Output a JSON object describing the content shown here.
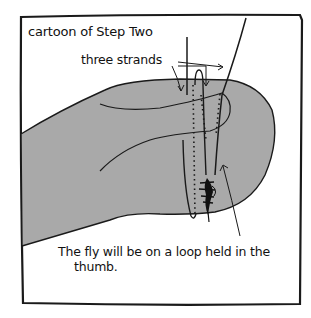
{
  "panel": {
    "title": "cartoon of Step Two",
    "annotations": {
      "strands_label": "three strands",
      "caption_line1": "The fly will be on a loop held in the",
      "caption_line2": "thumb."
    }
  },
  "colors": {
    "background": "#ffffff",
    "ink": "#111111",
    "thumb_fill": "#a9a9a9",
    "frame": "#1a1a1a"
  },
  "elements": {
    "thumb": "gray thumb shape",
    "strands_count": 3,
    "fly": "tied fly on loop"
  }
}
